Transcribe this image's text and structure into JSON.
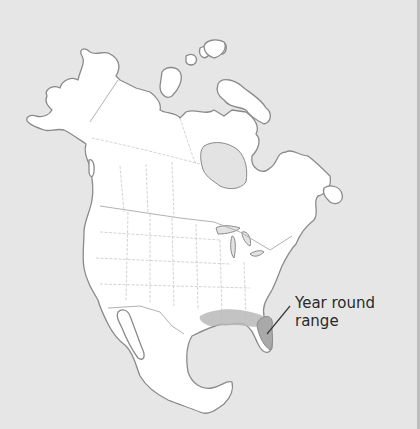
{
  "map": {
    "region": "North America",
    "colors": {
      "background": "#e6e6e6",
      "land": "#ffffff",
      "outline": "#8a8a8a",
      "range_fill": "#a9a9a9"
    },
    "legend": {
      "label_line1": "Year round",
      "label_line2": "range"
    }
  }
}
